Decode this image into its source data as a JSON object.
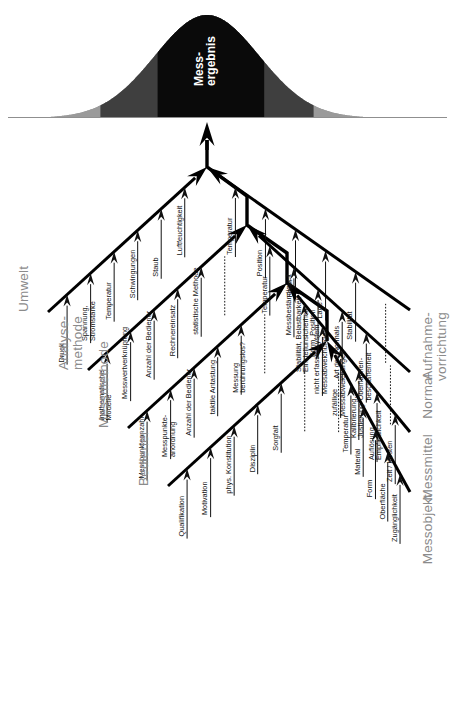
{
  "diagram": {
    "type": "ishikawa-fishbone",
    "orientation": "rotated-90-ccw",
    "head_label_line1": "Mess-",
    "head_label_line2": "ergebnis",
    "head_shape": "gaussian-bell-curve",
    "head_bands": [
      "light-gray-tails",
      "dark-gray-mid",
      "black-core"
    ],
    "colors": {
      "category_text": "#8b8b8b",
      "cause_text": "#111111",
      "spine": "#000000",
      "bell_core": "#0a0a0a",
      "bell_mid": "#3f3f3f",
      "bell_tail": "#9a9a9a",
      "head_text": "#ffffff"
    }
  },
  "categories_left": [
    {
      "id": "umwelt",
      "label": "Umwelt",
      "label_lines": [
        "Umwelt"
      ],
      "causes": [
        {
          "label_lines": [
            "Druck"
          ],
          "underline": true
        },
        {
          "label_lines": [
            "Spannung,",
            "Stromstärke"
          ],
          "underline": true
        },
        {
          "label_lines": [
            "Temperatur"
          ],
          "underline": true
        },
        {
          "label_lines": [
            "Schwingungen"
          ],
          "underline": true
        },
        {
          "label_lines": [
            "Staub"
          ],
          "underline": true
        },
        {
          "label_lines": [
            "Luftfeuchtigkeit"
          ],
          "underline": true
        }
      ]
    },
    {
      "id": "analysemethode",
      "label": "Analyse-methode",
      "label_lines": [
        "Analyse-",
        "methode"
      ],
      "causes": [
        {
          "label_lines": [
            "mathematische",
            "Modelle"
          ],
          "underline": true
        },
        {
          "label_lines": [
            "Messwertverknüpfung"
          ],
          "underline": true
        },
        {
          "label_lines": [
            "Anzahl der Bediener"
          ],
          "underline": true
        },
        {
          "label_lines": [
            "Rechnereinsatz"
          ],
          "underline": true
        },
        {
          "label_lines": [
            "statistische Methode"
          ],
          "underline": true
        },
        {
          "label_lines": [
            ""
          ],
          "underline": false,
          "dotted": true
        }
      ]
    },
    {
      "id": "messmethode",
      "label": "Messmethode",
      "label_lines": [
        "Messmethode"
      ],
      "causes": [
        {
          "label_lines": [
            "Messpunkteanzahl"
          ],
          "underline": true
        },
        {
          "label_lines": [
            "Messpunkte-",
            "anordnung"
          ],
          "underline": true
        },
        {
          "label_lines": [
            "Anzahl der Bediener"
          ],
          "underline": true
        },
        {
          "label_lines": [
            "taktile Antastung"
          ],
          "underline": true
        },
        {
          "label_lines": [
            "Messung",
            "berührungslos?"
          ],
          "underline": true
        },
        {
          "label_lines": [
            ""
          ],
          "underline": false,
          "dotted": true
        }
      ]
    },
    {
      "id": "bediener",
      "label": "Bediener",
      "label_lines": [
        "Bediener"
      ],
      "causes": [
        {
          "label_lines": [
            "Qualifikation"
          ],
          "underline": true
        },
        {
          "label_lines": [
            "Motivation"
          ],
          "underline": true
        },
        {
          "label_lines": [
            "phys. Konstitution"
          ],
          "underline": true
        },
        {
          "label_lines": [
            "Disziplin"
          ],
          "underline": true
        },
        {
          "label_lines": [
            "Sorgfalt"
          ],
          "underline": true
        },
        {
          "label_lines": [
            ""
          ],
          "underline": false,
          "dotted": true
        }
      ]
    }
  ],
  "categories_right": [
    {
      "id": "aufnahmevorrichtung",
      "label": "Aufnahmevorrichtung",
      "label_lines": [
        "Aufnahme-",
        "vorrichtung"
      ],
      "causes": [
        {
          "label_lines": [
            ""
          ],
          "underline": false,
          "dotted": true
        },
        {
          "label_lines": [
            "Stabilität"
          ],
          "underline": true
        },
        {
          "label_lines": [
            "Lage"
          ],
          "underline": true
        },
        {
          "label_lines": [
            "Form"
          ],
          "underline": true
        },
        {
          "label_lines": [
            "Position"
          ],
          "underline": true
        },
        {
          "label_lines": [
            "Temperatur"
          ],
          "underline": true
        }
      ]
    },
    {
      "id": "normal",
      "label": "Normal",
      "label_lines": [
        "Normal"
      ],
      "causes": [
        {
          "label_lines": [
            ""
          ],
          "underline": false,
          "dotted": true
        },
        {
          "label_lines": [
            "Oberflächen-",
            "beschaffenheit"
          ],
          "underline": true
        },
        {
          "label_lines": [
            "Art des Normals"
          ],
          "underline": true
        },
        {
          "label_lines": [
            "Form, Position"
          ],
          "underline": true
        },
        {
          "label_lines": [
            "Messbeständigkeit"
          ],
          "underline": true
        },
        {
          "label_lines": [
            "Temperatur"
          ],
          "underline": true
        }
      ]
    },
    {
      "id": "messmittel",
      "label": "Messmittel",
      "label_lines": [
        "Messmittel"
      ],
      "causes": [
        {
          "label_lines": [
            "Zeit / Kosten"
          ],
          "underline": true
        },
        {
          "label_lines": [
            "Auflösung,",
            "Empfindlichkeit"
          ],
          "underline": true
        },
        {
          "label_lines": [
            "Kalibrierung,",
            "Justierung"
          ],
          "underline": true
        },
        {
          "label_lines": [
            "zufällige",
            "Messabweichungen"
          ],
          "underline": true
        },
        {
          "label_lines": [
            "nicht erfasste system.",
            "Messabweichungen"
          ],
          "underline": true
        },
        {
          "label_lines": [
            "Stabilität, Belastbarkeit",
            "Einstellunsicherheit"
          ],
          "underline": true
        }
      ]
    },
    {
      "id": "messobjekt",
      "label": "Messobjekt",
      "label_lines": [
        "Messobjekt"
      ],
      "causes": [
        {
          "label_lines": [
            "Zugänglichkeit"
          ],
          "underline": true
        },
        {
          "label_lines": [
            "Oberfläche"
          ],
          "underline": true
        },
        {
          "label_lines": [
            "Form"
          ],
          "underline": true
        },
        {
          "label_lines": [
            "Material"
          ],
          "underline": true
        },
        {
          "label_lines": [
            "Temperatur"
          ],
          "underline": true
        },
        {
          "label_lines": [
            ""
          ],
          "underline": false,
          "dotted": true
        }
      ]
    }
  ]
}
